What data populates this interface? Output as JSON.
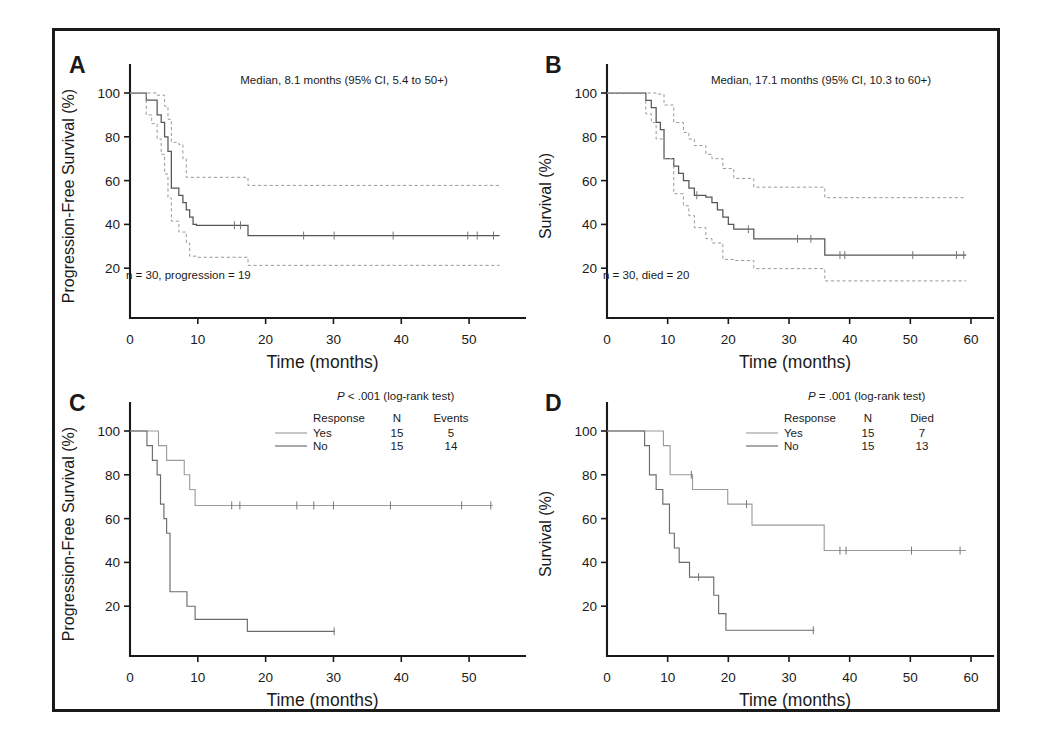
{
  "figure": {
    "panels": [
      "A",
      "B",
      "C",
      "D"
    ],
    "shared_xlabel": "Time (months)"
  },
  "chart_data": [
    {
      "id": "A",
      "type": "line",
      "subtype": "kaplan-meier",
      "panel_letter": "A",
      "title": "",
      "xlabel": "Time (months)",
      "ylabel": "Progression-Free Survival (%)",
      "xlim": [
        0,
        55
      ],
      "ylim": [
        0,
        108
      ],
      "xticks": [
        0,
        10,
        20,
        30,
        40,
        50
      ],
      "yticks": [
        20,
        40,
        60,
        80,
        100
      ],
      "grid": false,
      "annotation_median": "Median, 8.1 months (95% CI, 5.4 to 50+)",
      "annotation_n": "n = 30, progression = 19",
      "series": [
        {
          "name": "Progression-free survival estimate",
          "style": "solid",
          "x": [
            0,
            2.4,
            2.4,
            3.2,
            3.2,
            4.0,
            4.0,
            4.6,
            4.6,
            5.1,
            5.1,
            5.6,
            5.6,
            6.1,
            6.1,
            7.2,
            7.2,
            7.8,
            7.8,
            8.3,
            8.3,
            8.8,
            8.8,
            9.3,
            9.3,
            9.8,
            9.8,
            17.4,
            17.4,
            54.5
          ],
          "y": [
            100,
            100,
            96.7,
            96.7,
            96.7,
            96.7,
            90.0,
            90.0,
            86.6,
            86.6,
            80.0,
            80.0,
            73.3,
            73.3,
            56.6,
            56.6,
            53.3,
            53.3,
            50.0,
            50.0,
            46.6,
            46.6,
            43.3,
            43.3,
            40.0,
            40.0,
            39.6,
            39.6,
            34.9,
            34.9
          ]
        },
        {
          "name": "Upper 95% confidence limit",
          "style": "dashed",
          "x": [
            0,
            2.4,
            2.4,
            4.0,
            4.0,
            5.1,
            5.1,
            5.6,
            5.6,
            6.1,
            6.1,
            7.2,
            7.2,
            7.8,
            7.8,
            8.3,
            8.3,
            9.8,
            9.8,
            17.4,
            17.4,
            54.5
          ],
          "y": [
            100,
            100,
            100,
            100,
            99.0,
            99.0,
            94.0,
            94.0,
            88.0,
            88.0,
            77.5,
            77.5,
            76.5,
            76.5,
            70.0,
            70.0,
            61.5,
            61.5,
            61.5,
            61.5,
            57.8,
            57.8
          ]
        },
        {
          "name": "Lower 95% confidence limit",
          "style": "dashed",
          "x": [
            0,
            2.4,
            2.4,
            3.2,
            3.2,
            4.0,
            4.0,
            4.6,
            4.6,
            5.1,
            5.1,
            5.6,
            5.6,
            6.1,
            6.1,
            7.2,
            7.2,
            8.3,
            8.3,
            8.8,
            8.8,
            9.8,
            9.8,
            17.4,
            17.4,
            54.5
          ],
          "y": [
            100,
            100,
            90.0,
            90.0,
            86.0,
            86.0,
            79.0,
            79.0,
            72.0,
            72.0,
            63.0,
            63.0,
            52.0,
            52.0,
            41.5,
            41.5,
            36.5,
            36.5,
            31.5,
            31.5,
            25.5,
            25.5,
            25.0,
            25.0,
            21.3,
            21.3
          ]
        }
      ],
      "censor_marks": [
        {
          "x": 15.4,
          "y": 39.6
        },
        {
          "x": 16.3,
          "y": 39.6
        },
        {
          "x": 25.6,
          "y": 34.9
        },
        {
          "x": 30.1,
          "y": 34.9
        },
        {
          "x": 38.8,
          "y": 34.9
        },
        {
          "x": 49.8,
          "y": 34.9
        },
        {
          "x": 51.2,
          "y": 34.9
        },
        {
          "x": 53.6,
          "y": 34.9
        }
      ]
    },
    {
      "id": "B",
      "type": "line",
      "subtype": "kaplan-meier",
      "panel_letter": "B",
      "title": "",
      "xlabel": "Time (months)",
      "ylabel": "Survival (%)",
      "xlim": [
        0,
        60
      ],
      "ylim": [
        0,
        108
      ],
      "xticks": [
        0,
        10,
        20,
        30,
        40,
        50,
        60
      ],
      "yticks": [
        20,
        40,
        60,
        80,
        100
      ],
      "grid": false,
      "annotation_median": "Median, 17.1 months (95% CI, 10.3 to 60+)",
      "annotation_n": "n = 30, died = 20",
      "series": [
        {
          "name": "Overall survival estimate",
          "style": "solid",
          "x": [
            0,
            6.4,
            6.4,
            7.3,
            7.3,
            8.1,
            8.1,
            8.8,
            8.8,
            9.4,
            9.4,
            11.0,
            11.0,
            11.8,
            11.8,
            12.6,
            12.6,
            13.5,
            13.5,
            14.4,
            14.4,
            16.3,
            16.3,
            17.3,
            17.3,
            18.2,
            18.2,
            19.1,
            19.1,
            20.0,
            20.0,
            20.9,
            20.9,
            24.2,
            24.2,
            35.9,
            35.9,
            59.2
          ],
          "y": [
            100,
            100,
            96.6,
            96.6,
            93.3,
            93.3,
            86.6,
            86.6,
            83.3,
            83.3,
            70.0,
            70.0,
            66.6,
            66.6,
            63.3,
            63.3,
            60.0,
            60.0,
            56.6,
            56.6,
            53.3,
            53.3,
            52.5,
            52.5,
            50.0,
            50.0,
            46.6,
            46.6,
            43.3,
            43.3,
            40.0,
            40.0,
            37.8,
            37.8,
            33.4,
            33.4,
            26.0,
            26.0
          ]
        },
        {
          "name": "Upper 95% confidence limit",
          "style": "dashed",
          "x": [
            0,
            6.4,
            6.4,
            8.1,
            8.1,
            9.4,
            9.4,
            11.0,
            11.0,
            12.6,
            12.6,
            13.5,
            13.5,
            14.4,
            14.4,
            16.3,
            16.3,
            17.3,
            17.3,
            19.1,
            19.1,
            20.9,
            20.9,
            24.2,
            24.2,
            35.9,
            35.9,
            59.2
          ],
          "y": [
            100,
            100,
            100,
            100,
            99.5,
            99.5,
            94.5,
            94.5,
            86.5,
            86.5,
            82.0,
            82.0,
            79.0,
            79.0,
            76.0,
            76.0,
            72.0,
            72.0,
            70.0,
            70.0,
            65.5,
            65.5,
            61.0,
            61.0,
            57.0,
            57.0,
            52.2,
            52.2
          ]
        },
        {
          "name": "Lower 95% confidence limit",
          "style": "dashed",
          "x": [
            0,
            6.4,
            6.4,
            7.3,
            7.3,
            8.1,
            8.1,
            9.4,
            9.4,
            11.0,
            11.0,
            12.6,
            12.6,
            13.5,
            13.5,
            14.4,
            14.4,
            16.3,
            16.3,
            17.3,
            17.3,
            19.1,
            19.1,
            20.9,
            20.9,
            24.2,
            24.2,
            35.9,
            35.9,
            59.2
          ],
          "y": [
            100,
            100,
            90.5,
            90.5,
            86.5,
            86.5,
            79.0,
            79.0,
            70.0,
            70.0,
            54.0,
            54.0,
            48.5,
            48.5,
            44.0,
            44.0,
            38.5,
            38.5,
            33.5,
            33.5,
            31.5,
            31.5,
            24.0,
            24.0,
            23.5,
            23.5,
            19.8,
            19.8,
            14.2,
            14.2
          ]
        }
      ],
      "censor_marks": [
        {
          "x": 14.8,
          "y": 53.3
        },
        {
          "x": 23.3,
          "y": 37.8
        },
        {
          "x": 31.4,
          "y": 33.4
        },
        {
          "x": 33.6,
          "y": 33.4
        },
        {
          "x": 38.4,
          "y": 26.0
        },
        {
          "x": 39.2,
          "y": 26.0
        },
        {
          "x": 50.4,
          "y": 26.0
        },
        {
          "x": 57.6,
          "y": 26.0
        },
        {
          "x": 58.8,
          "y": 26.0
        }
      ]
    },
    {
      "id": "C",
      "type": "line",
      "subtype": "kaplan-meier",
      "panel_letter": "C",
      "title": "",
      "xlabel": "Time (months)",
      "ylabel": "Progression-Free Survival (%)",
      "xlim": [
        0,
        55
      ],
      "ylim": [
        0,
        108
      ],
      "xticks": [
        0,
        10,
        20,
        30,
        40,
        50
      ],
      "yticks": [
        20,
        40,
        60,
        80,
        100
      ],
      "grid": false,
      "p_value_text": "P < .001 (log-rank test)",
      "p_symbol": "P",
      "p_rest": " < .001 (log-rank test)",
      "legend": {
        "headers": [
          "Response",
          "N",
          "Events"
        ],
        "rows": [
          {
            "label": "Yes",
            "n": "15",
            "events": "5",
            "style": "light"
          },
          {
            "label": "No",
            "n": "15",
            "events": "14",
            "style": "dark"
          }
        ]
      },
      "series": [
        {
          "name": "Yes",
          "style": "light",
          "x": [
            0,
            2.5,
            2.5,
            4.2,
            4.2,
            5.4,
            5.4,
            8.0,
            8.0,
            8.8,
            8.8,
            9.6,
            9.6,
            53.5
          ],
          "y": [
            100,
            100,
            100,
            100,
            93.3,
            93.3,
            86.6,
            86.6,
            80.0,
            80.0,
            73.3,
            73.3,
            66.0,
            66.0
          ]
        },
        {
          "name": "No",
          "style": "dark",
          "x": [
            0,
            2.5,
            2.5,
            3.3,
            3.3,
            4.0,
            4.0,
            4.5,
            4.5,
            5.0,
            5.0,
            5.4,
            5.4,
            5.9,
            5.9,
            7.6,
            7.6,
            8.4,
            8.4,
            9.6,
            9.6,
            17.3,
            17.3,
            30.2
          ],
          "y": [
            100,
            100,
            93.3,
            93.3,
            86.6,
            86.6,
            80.0,
            80.0,
            66.6,
            66.6,
            60.0,
            60.0,
            53.3,
            53.3,
            26.6,
            26.6,
            26.6,
            26.6,
            20.0,
            20.0,
            14.0,
            14.0,
            8.5,
            8.5
          ]
        }
      ],
      "censor_marks": [
        {
          "x": 15.0,
          "y": 66.0,
          "series": "Yes"
        },
        {
          "x": 16.2,
          "y": 66.0,
          "series": "Yes"
        },
        {
          "x": 24.6,
          "y": 66.0,
          "series": "Yes"
        },
        {
          "x": 27.1,
          "y": 66.0,
          "series": "Yes"
        },
        {
          "x": 30.0,
          "y": 66.0,
          "series": "Yes"
        },
        {
          "x": 38.4,
          "y": 66.0,
          "series": "Yes"
        },
        {
          "x": 48.9,
          "y": 66.0,
          "series": "Yes"
        },
        {
          "x": 53.2,
          "y": 66.0,
          "series": "Yes"
        },
        {
          "x": 30.1,
          "y": 8.5,
          "series": "No"
        }
      ]
    },
    {
      "id": "D",
      "type": "line",
      "subtype": "kaplan-meier",
      "panel_letter": "D",
      "title": "",
      "xlabel": "Time (months)",
      "ylabel": "Survival (%)",
      "xlim": [
        0,
        60
      ],
      "ylim": [
        0,
        108
      ],
      "xticks": [
        0,
        10,
        20,
        30,
        40,
        50,
        60
      ],
      "yticks": [
        20,
        40,
        60,
        80,
        100
      ],
      "grid": false,
      "p_value_text": "P = .001 (log-rank test)",
      "p_symbol": "P",
      "p_rest": " = .001 (log-rank test)",
      "legend": {
        "headers": [
          "Response",
          "N",
          "Died"
        ],
        "rows": [
          {
            "label": "Yes",
            "n": "15",
            "died": "7",
            "style": "light"
          },
          {
            "label": "No",
            "n": "15",
            "died": "13",
            "style": "dark"
          }
        ]
      },
      "series": [
        {
          "name": "Yes",
          "style": "light",
          "x": [
            0,
            6.8,
            6.8,
            9.3,
            9.3,
            10.4,
            10.4,
            14.1,
            14.1,
            19.9,
            19.9,
            23.9,
            23.9,
            35.8,
            35.8,
            59.2
          ],
          "y": [
            100,
            100,
            100,
            100,
            93.3,
            93.3,
            80.0,
            80.0,
            73.3,
            73.3,
            66.6,
            66.6,
            57.0,
            57.0,
            45.4,
            45.4
          ]
        },
        {
          "name": "No",
          "style": "dark",
          "x": [
            0,
            6.2,
            6.2,
            7.0,
            7.0,
            8.1,
            8.1,
            9.2,
            9.2,
            10.3,
            10.3,
            11.1,
            11.1,
            11.9,
            11.9,
            13.6,
            13.6,
            16.5,
            16.5,
            17.6,
            17.6,
            18.4,
            18.4,
            19.6,
            19.6,
            34.2
          ],
          "y": [
            100,
            100,
            93.3,
            93.3,
            80.0,
            80.0,
            73.3,
            73.3,
            66.6,
            66.6,
            53.3,
            53.3,
            46.6,
            46.6,
            40.0,
            40.0,
            33.3,
            33.3,
            33.3,
            33.3,
            25.0,
            25.0,
            16.6,
            16.6,
            9.0,
            9.0
          ]
        }
      ],
      "censor_marks": [
        {
          "x": 13.9,
          "y": 80.0,
          "series": "Yes"
        },
        {
          "x": 23.0,
          "y": 66.6,
          "series": "Yes"
        },
        {
          "x": 38.4,
          "y": 45.4,
          "series": "Yes"
        },
        {
          "x": 39.4,
          "y": 45.4,
          "series": "Yes"
        },
        {
          "x": 50.2,
          "y": 45.4,
          "series": "Yes"
        },
        {
          "x": 58.2,
          "y": 45.4,
          "series": "Yes"
        },
        {
          "x": 15.1,
          "y": 33.3,
          "series": "No"
        },
        {
          "x": 34.0,
          "y": 9.0,
          "series": "No"
        }
      ]
    }
  ],
  "colors": {
    "frame": "#1a1a1a",
    "axis": "#1a1a1a",
    "curve_main": "#555555",
    "curve_ci": "#999999",
    "curve_light": "#9a9a9a",
    "curve_dark": "#6b6b6b",
    "background": "#ffffff"
  }
}
